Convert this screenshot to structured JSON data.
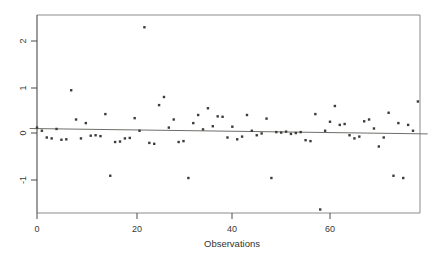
{
  "chart_data": {
    "type": "scatter",
    "title": "",
    "subtitle": "",
    "xlabel": "Observations",
    "ylabel": "",
    "xlim": [
      -1.5,
      80
    ],
    "ylim": [
      -2.1,
      2.65
    ],
    "xticks": [
      0,
      20,
      40,
      60
    ],
    "xtick_labels": [
      "0",
      "20",
      "40",
      "60"
    ],
    "yticks": [
      -1,
      0,
      1,
      2
    ],
    "ytick_labels": [
      "-1",
      "0",
      "1",
      "2"
    ],
    "grid": false,
    "legend": null,
    "marker": "square",
    "marker_color": "#3c3c3a",
    "reference_line": {
      "type": "line",
      "description": "fitted near-zero horizontal trend line",
      "x": [
        -1.5,
        80
      ],
      "y": [
        0.1,
        -0.02
      ],
      "color": "#6e6e6a"
    },
    "series": [
      {
        "name": "residuals",
        "x": [
          0,
          1,
          2,
          3,
          4,
          5,
          6,
          7,
          8,
          9,
          10,
          11,
          12,
          13,
          14,
          15,
          16,
          17,
          18,
          19,
          20,
          21,
          22,
          23,
          24,
          25,
          26,
          27,
          28,
          29,
          30,
          31,
          32,
          33,
          34,
          35,
          36,
          37,
          38,
          39,
          40,
          41,
          42,
          43,
          44,
          45,
          46,
          47,
          48,
          49,
          50,
          51,
          52,
          53,
          54,
          55,
          56,
          57,
          58,
          59,
          60,
          61,
          62,
          63,
          64,
          65,
          66,
          67,
          68,
          69,
          70,
          71,
          72,
          73,
          74,
          75,
          76,
          77,
          78
        ],
        "y": [
          0.12,
          0.05,
          -0.1,
          -0.12,
          0.09,
          -0.15,
          -0.14,
          0.95,
          0.3,
          -0.12,
          0.22,
          -0.06,
          -0.05,
          -0.07,
          0.42,
          -0.95,
          -0.2,
          -0.19,
          -0.12,
          -0.11,
          0.33,
          0.05,
          2.35,
          -0.22,
          -0.24,
          0.62,
          0.8,
          0.12,
          0.3,
          -0.2,
          -0.18,
          -1.0,
          0.22,
          0.4,
          0.08,
          0.55,
          0.15,
          0.37,
          0.36,
          -0.1,
          0.14,
          -0.14,
          -0.08,
          0.4,
          0.05,
          -0.05,
          -0.01,
          0.32,
          -1.0,
          0.02,
          0.01,
          0.03,
          -0.02,
          0.0,
          0.02,
          -0.16,
          -0.18,
          0.42,
          -1.7,
          0.05,
          0.25,
          0.6,
          0.18,
          0.2,
          -0.05,
          -0.12,
          -0.08,
          0.26,
          0.3,
          0.1,
          -0.3,
          -0.1,
          0.45,
          -0.95,
          0.22,
          -1.0,
          0.18,
          0.05,
          0.7
        ]
      }
    ]
  },
  "figure": {
    "frame_color": "#6f6f6b",
    "background": "#ffffff",
    "axis_color": "#4a4a46",
    "tick_color": "#4a4a46"
  }
}
